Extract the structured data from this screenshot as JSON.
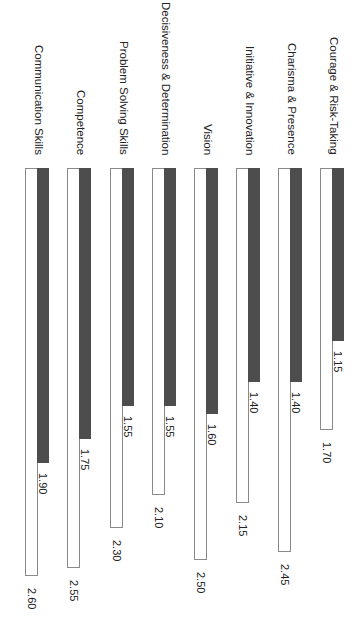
{
  "chart_data": {
    "type": "bar",
    "orientation": "horizontal bars, image rotated 90° clockwise",
    "title": "",
    "xlabel": "",
    "ylabel": "",
    "grid": false,
    "legend": null,
    "categories": [
      "Courage & Risk-Taking",
      "Charisma & Presence",
      "Initiative & Innovation",
      "Vision",
      "Decisiveness & Determination",
      "Problem Solving Skills",
      "Competence",
      "Communication Skills"
    ],
    "series": [
      {
        "name": "Series 1 (dark)",
        "color": "#4d4d4d",
        "values": [
          1.15,
          1.4,
          1.4,
          1.6,
          1.55,
          1.55,
          1.75,
          1.9
        ],
        "labels": [
          "1.15",
          "1.40",
          "1.40",
          "1.60",
          "1.55",
          "1.55",
          "1.75",
          "1.90"
        ]
      },
      {
        "name": "Series 2 (white)",
        "color": "#ffffff",
        "values": [
          1.7,
          2.45,
          2.15,
          2.5,
          2.1,
          2.3,
          2.55,
          2.6
        ],
        "labels": [
          "1.70",
          "2.45",
          "2.15",
          "2.50",
          "2.10",
          "2.30",
          "2.55",
          "2.60"
        ]
      }
    ],
    "value_range": [
      0,
      2.6
    ]
  }
}
